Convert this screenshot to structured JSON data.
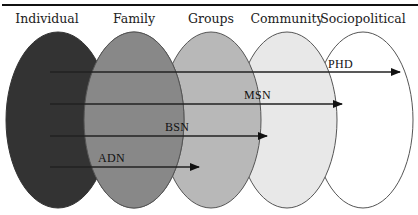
{
  "diagram": {
    "levels": [
      {
        "label": "Individual",
        "fill": "#333333",
        "cx": 58,
        "label_x": 47
      },
      {
        "label": "Family",
        "fill": "#888888",
        "cx": 134,
        "label_x": 134
      },
      {
        "label": "Groups",
        "fill": "#b8b8b8",
        "cx": 211,
        "label_x": 211
      },
      {
        "label": "Community",
        "fill": "#e8e8e8",
        "cx": 287,
        "label_x": 287
      },
      {
        "label": "Sociopolitical",
        "fill": "#ffffff",
        "cx": 363,
        "label_x": 363
      }
    ],
    "degrees": [
      {
        "label": "PHD",
        "y": 72,
        "x_end": 400,
        "label_x": 328,
        "label_y": 67
      },
      {
        "label": "MSN",
        "y": 104,
        "x_end": 342,
        "label_x": 244,
        "label_y": 98
      },
      {
        "label": "BSN",
        "y": 136,
        "x_end": 267,
        "label_x": 165,
        "label_y": 130
      },
      {
        "label": "ADN",
        "y": 167,
        "x_end": 199,
        "label_x": 98,
        "label_y": 161
      }
    ],
    "line_color": "#222222",
    "outline_color": "#555555"
  }
}
